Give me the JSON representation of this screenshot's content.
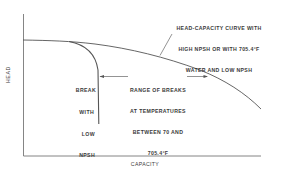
{
  "diagram": {
    "title": "",
    "axes": {
      "x_label": "CAPACITY",
      "y_label": "HEAD"
    },
    "annotations": {
      "curve_label": [
        "HEAD-CAPACITY CURVE WITH",
        "HIGH NPSH OR WITH 705.4°F",
        "WATER AND LOW NPSH"
      ],
      "break_label": [
        "BREAK",
        "WITH",
        "LOW",
        "NPSH",
        "AT",
        "70°F"
      ],
      "range_label": [
        "RANGE OF BREAKS",
        "AT TEMPERATURES",
        "BETWEEN 70 AND",
        "705.4°F"
      ]
    },
    "curves": [
      {
        "name": "head-capacity-curve",
        "description": "High NPSH or 705.4°F water with low NPSH"
      },
      {
        "name": "break-curve-70F",
        "description": "Break with low NPSH at 70°F"
      }
    ],
    "colors": {
      "line": "#555555",
      "text": "#3a3a3a",
      "background": "#ffffff"
    }
  }
}
